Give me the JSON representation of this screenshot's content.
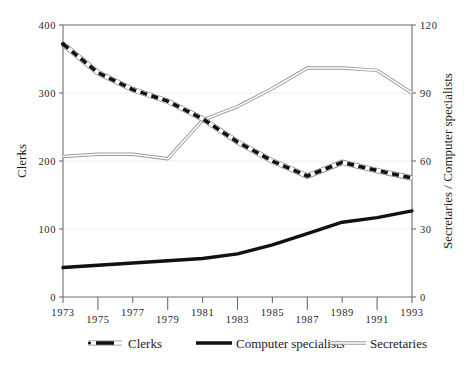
{
  "chart_data": {
    "type": "line",
    "title": "",
    "subtitle": "",
    "x": [
      1973,
      1975,
      1977,
      1979,
      1981,
      1983,
      1985,
      1987,
      1989,
      1991,
      1993
    ],
    "xlabel": "",
    "xtick_labels": [
      "1973",
      "1975",
      "1977",
      "1979",
      "1981",
      "1983",
      "1985",
      "1987",
      "1989",
      "1991",
      "1993"
    ],
    "xtick_stagger": true,
    "grid": true,
    "legend_position": "bottom",
    "axes": [
      {
        "id": "left",
        "label": "Clerks",
        "ylim": [
          0,
          400
        ],
        "ticks": [
          0,
          100,
          200,
          300,
          400
        ],
        "tick_labels": [
          "0",
          "100",
          "200",
          "300",
          "400"
        ]
      },
      {
        "id": "right",
        "label": "Secretaries / Computer specialists",
        "ylim": [
          0,
          120
        ],
        "ticks": [
          0,
          30,
          60,
          90,
          120
        ],
        "tick_labels": [
          "0",
          "30",
          "60",
          "90",
          "120"
        ]
      }
    ],
    "series": [
      {
        "name": "Clerks",
        "axis": "left",
        "style": "dashed-outlined",
        "values": [
          372,
          330,
          305,
          288,
          262,
          228,
          200,
          178,
          198,
          186,
          175
        ]
      },
      {
        "name": "Computer specialists",
        "axis": "right",
        "style": "thick-solid",
        "values": [
          13,
          14,
          15,
          16,
          17,
          19,
          23,
          28,
          33,
          35,
          38
        ]
      },
      {
        "name": "Secretaries",
        "axis": "right",
        "style": "thin-double",
        "values": [
          62,
          63,
          63,
          61,
          78,
          84,
          92,
          101,
          101,
          100,
          90
        ]
      }
    ],
    "legend": [
      {
        "label": "Clerks",
        "marker": "dashed-outlined"
      },
      {
        "label": "Computer specialists",
        "marker": "thick-solid"
      },
      {
        "label": "Secretaries",
        "marker": "thin-double"
      }
    ]
  }
}
